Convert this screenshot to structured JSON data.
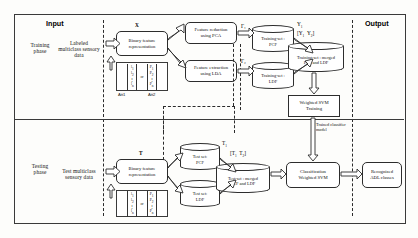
{
  "diagram": {
    "columns": {
      "input_label": "Input",
      "output_label": "Output"
    },
    "phases": {
      "training": "Training\nphase",
      "training_line1": "Training",
      "training_line2": "phase",
      "testing_line1": "Testing",
      "testing_line2": "phase"
    },
    "training": {
      "data_source_line1": "Labeled",
      "data_source_line2": "multiclass sensory",
      "data_source_line3": "data",
      "binary_feature_line1": "Binary feature",
      "binary_feature_line2": "representation",
      "binary_feature_tag": "X",
      "matrix_left": "l₁\nl₂\n⋮\nlₙ",
      "matrix_right": "P₁\nP₂\n⋮\nPₙ",
      "matrix_or": "or",
      "att1_label": "Att1",
      "att2_label": "Att2",
      "pca_line1": "Feature reduction",
      "pca_line2": "using PCA",
      "lda_line1": "Feature extraction",
      "lda_line2": "using LDA",
      "f1_tag": "Γ₁",
      "f2_tag": "Γ₂",
      "pcf_store_line1": "Training-set :",
      "pcf_store_line2": "PCF",
      "ldf_store_line1": "Training-set :",
      "ldf_store_line2": "LDF",
      "y1_tag": "Y₁",
      "y2_tag": "Y₂",
      "merged_tag": "[Y₁   Y₂]",
      "merged_store_line1": "Training-set : merged",
      "merged_store_line2": "PCF and LDF",
      "svm_train_line1": "Weighted SVM",
      "svm_train_line2": "Training",
      "trained_model_line1": "Trained classifier",
      "trained_model_line2": "model"
    },
    "testing": {
      "data_source_line1": "Test multiclass",
      "data_source_line2": "sensory data",
      "binary_feature_line1": "Binary feature",
      "binary_feature_line2": "representation",
      "binary_feature_tag": "T",
      "matrix_left": "l₁\nl₂\n⋮\nlₙ",
      "matrix_right": "P₁\nP₂\n⋮\nPₙ",
      "matrix_or": "or",
      "pcf_test_line1": "Test set:",
      "pcf_test_line2": "PCF",
      "ldf_test_line1": "Test set:",
      "ldf_test_line2": "LDF",
      "t1_tag": "T₁",
      "t2_tag": "T₂",
      "merged_tag": "[T₁   T₂]",
      "merged_store_line1": "Test-set : merged",
      "merged_store_line2": "PCF and LDF",
      "classify_line1": "Classification",
      "classify_line2": "Weighted SVM"
    },
    "output": {
      "result_line1": "Recognized",
      "result_line2": "ADL classes"
    },
    "colors": {
      "stroke": "#2d2d2d",
      "background": "#fdfdfb",
      "text": "#111111"
    }
  }
}
